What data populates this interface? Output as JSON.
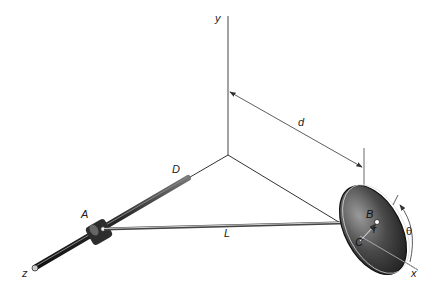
{
  "diagram": {
    "type": "mechanism",
    "labels": {
      "y_axis": "y",
      "x_axis": "x",
      "z_axis": "z",
      "distance": "d",
      "rod_end": "D",
      "collar": "A",
      "link": "L",
      "pin": "B",
      "radius": "r",
      "center": "C",
      "angle": "θ"
    },
    "colors": {
      "line": "#3a3a3a",
      "rod_dark": "#2a2a2a",
      "disk_dark": "#222222",
      "disk_light": "#8a8a8a",
      "link": "#9a9a9a"
    }
  }
}
